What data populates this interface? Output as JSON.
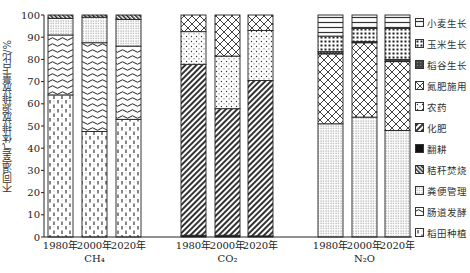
{
  "chart_data": {
    "type": "bar",
    "stacked": true,
    "title": "",
    "ylabel": "不同温室气体排放源排放量占比/%",
    "xlabel": "",
    "ylim": [
      0,
      100
    ],
    "yticks": [
      0,
      10,
      20,
      30,
      40,
      50,
      60,
      70,
      80,
      90,
      100
    ],
    "grid": false,
    "legend_position": "right",
    "groups": [
      {
        "gas": "CH₄",
        "categories": [
          "1980年",
          "2000年",
          "2020年"
        ]
      },
      {
        "gas": "CO₂",
        "categories": [
          "1980年",
          "2000年",
          "2020年"
        ]
      },
      {
        "gas": "N₂O",
        "categories": [
          "1980年",
          "2000年",
          "2020年"
        ]
      }
    ],
    "legend": [
      "小麦生长",
      "玉米生长",
      "稻谷生长",
      "氮肥施用",
      "农药",
      "化肥",
      "翻耕",
      "秸秆焚烧",
      "粪便管理",
      "肠道发酵",
      "稻田种植"
    ],
    "series": [
      {
        "name": "稻田种植",
        "values": {
          "CH₄": [
            64,
            47.5,
            53
          ],
          "CO₂": [
            0,
            0,
            0
          ],
          "N₂O": [
            0,
            0,
            0
          ]
        }
      },
      {
        "name": "肠道发酵",
        "values": {
          "CH₄": [
            27,
            40,
            33
          ],
          "CO₂": [
            0,
            0,
            0
          ],
          "N₂O": [
            0,
            0,
            0
          ]
        }
      },
      {
        "name": "粪便管理",
        "values": {
          "CH₄": [
            7.5,
            11.5,
            12
          ],
          "CO₂": [
            0,
            0,
            0
          ],
          "N₂O": [
            51,
            54,
            48
          ]
        }
      },
      {
        "name": "秸秆焚烧",
        "values": {
          "CH₄": [
            1.5,
            1,
            2
          ],
          "CO₂": [
            0,
            0,
            0
          ],
          "N₂O": [
            0,
            0,
            0
          ]
        }
      },
      {
        "name": "翻耕",
        "values": {
          "CH₄": [
            0,
            0,
            0
          ],
          "CO₂": [
            0.8,
            0.8,
            0.5
          ],
          "N₂O": [
            0,
            0,
            0
          ]
        }
      },
      {
        "name": "化肥",
        "values": {
          "CH₄": [
            0,
            0,
            0
          ],
          "CO₂": [
            77,
            57,
            70
          ],
          "N₂O": [
            0,
            0,
            0
          ]
        }
      },
      {
        "name": "农药",
        "values": {
          "CH₄": [
            0,
            0,
            0
          ],
          "CO₂": [
            14.7,
            23.7,
            22.5
          ],
          "N₂O": [
            0,
            0,
            0
          ]
        }
      },
      {
        "name": "氮肥施用",
        "values": {
          "CH₄": [
            0,
            0,
            0
          ],
          "CO₂": [
            7.5,
            18.5,
            7
          ],
          "N₂O": [
            31.5,
            33.5,
            31
          ]
        }
      },
      {
        "name": "稻谷生长",
        "values": {
          "CH₄": [
            0,
            0,
            0
          ],
          "CO₂": [
            0,
            0,
            0
          ],
          "N₂O": [
            1,
            0.5,
            1
          ]
        }
      },
      {
        "name": "玉米生长",
        "values": {
          "CH₄": [
            0,
            0,
            0
          ],
          "CO₂": [
            0,
            0,
            0
          ],
          "N₂O": [
            7,
            6,
            14
          ]
        }
      },
      {
        "name": "小麦生长",
        "values": {
          "CH₄": [
            0,
            0,
            0
          ],
          "CO₂": [
            0,
            0,
            0
          ],
          "N₂O": [
            9.5,
            6,
            6
          ]
        }
      }
    ]
  },
  "axis": {
    "ylabel": "不同温室气体排放源排放量占比/%",
    "yticks": [
      "0",
      "10",
      "20",
      "30",
      "40",
      "50",
      "60",
      "70",
      "80",
      "90",
      "100"
    ]
  },
  "legend": {
    "items": [
      {
        "label": "小麦生长",
        "pattern": "hlines"
      },
      {
        "label": "玉米生长",
        "pattern": "bigdots"
      },
      {
        "label": "稻谷生长",
        "pattern": "dark"
      },
      {
        "label": "氮肥施用",
        "pattern": "crosshatch"
      },
      {
        "label": "农药",
        "pattern": "finedots"
      },
      {
        "label": "化肥",
        "pattern": "diagonal"
      },
      {
        "label": "翻耕",
        "pattern": "solid"
      },
      {
        "label": "秸秆焚烧",
        "pattern": "darkdiag"
      },
      {
        "label": "粪便管理",
        "pattern": "densedots"
      },
      {
        "label": "肠道发酵",
        "pattern": "wavy"
      },
      {
        "label": "稻田种植",
        "pattern": "dashes"
      }
    ]
  },
  "groups": [
    {
      "gas": "CH₄",
      "years": [
        "1980年",
        "2000年",
        "2020年"
      ]
    },
    {
      "gas": "CO₂",
      "years": [
        "1980年",
        "2000年",
        "2020年"
      ]
    },
    {
      "gas": "N₂O",
      "years": [
        "1980年",
        "2000年",
        "2020年"
      ]
    }
  ]
}
